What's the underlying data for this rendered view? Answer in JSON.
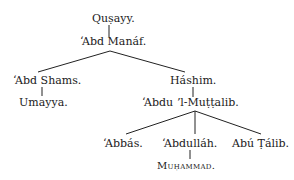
{
  "tree": {
    "nodes": {
      "qusayy": "Quṣayy.",
      "abd_manaf": "ʻAbd Manáf.",
      "abd_shams": "ʻAbd Shams.",
      "umayya": "Umayya.",
      "hashim": "Háshim.",
      "abdu_l_muttalib": "ʻAbdu ʼl-Muṭṭalib.",
      "abbas": "ʻAbbás.",
      "abdullah": "ʻAbdulláh.",
      "abu_talib": "Abú Ṭálib.",
      "muhammad": "Muḥammad."
    },
    "edges": [
      [
        "qusayy",
        "abd_manaf"
      ],
      [
        "abd_manaf",
        "abd_shams"
      ],
      [
        "abd_manaf",
        "hashim"
      ],
      [
        "abd_shams",
        "umayya"
      ],
      [
        "hashim",
        "abdu_l_muttalib"
      ],
      [
        "abdu_l_muttalib",
        "abbas"
      ],
      [
        "abdu_l_muttalib",
        "abdullah"
      ],
      [
        "abdu_l_muttalib",
        "abu_talib"
      ],
      [
        "abdullah",
        "muhammad"
      ]
    ]
  }
}
